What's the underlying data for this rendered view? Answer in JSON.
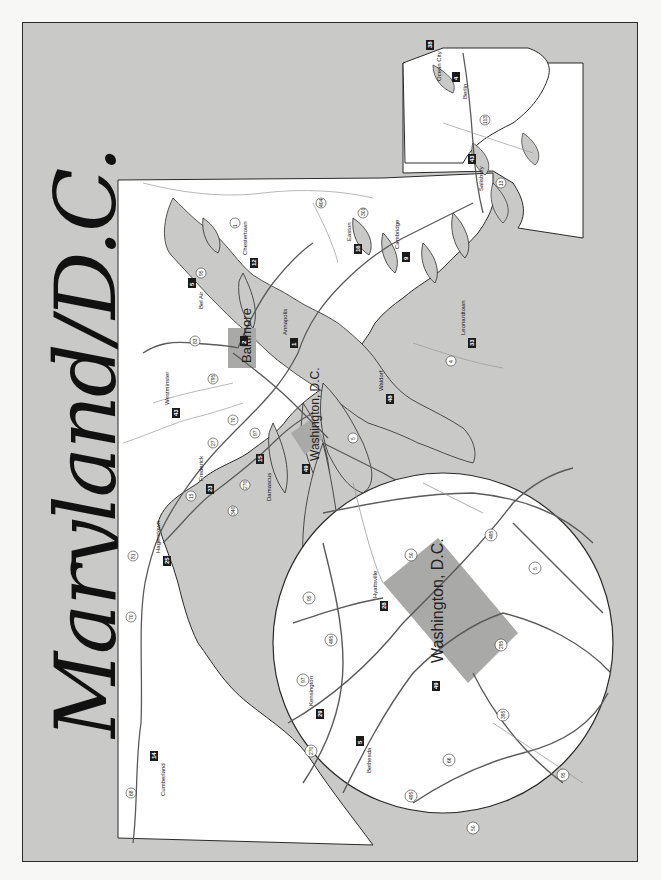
{
  "title": "Maryland/D.C.",
  "colors": {
    "background": "#f7f7f5",
    "water": "#c9c9c7",
    "land": "#ffffff",
    "metro_area": "#a9a9a7",
    "border": "#2a2a2a",
    "roads": "#5a5a5a",
    "label_box": "#1a1a1a"
  },
  "cities": [
    {
      "name": "Cumberland",
      "num": "14"
    },
    {
      "name": "Hagerstown",
      "num": "25"
    },
    {
      "name": "Boonsboro",
      "num": "3"
    },
    {
      "name": "Frederick",
      "num": "23"
    },
    {
      "name": "Knoxville",
      "num": "30"
    },
    {
      "name": "Brunswick",
      "num": "8"
    },
    {
      "name": "Emmitsburg",
      "num": "17"
    },
    {
      "name": "Westminster",
      "num": "43"
    },
    {
      "name": "Reisterstown",
      "num": "41"
    },
    {
      "name": "New Market",
      "num": "36"
    },
    {
      "name": "Mount Airy",
      "num": "33"
    },
    {
      "name": "Sykesville",
      "num": "45"
    },
    {
      "name": "Damascus",
      "num": "15"
    },
    {
      "name": "Laytonsville",
      "num": "31"
    },
    {
      "name": "Gaithersburg",
      "num": "24"
    },
    {
      "name": "Olney",
      "num": "38"
    },
    {
      "name": "Ellicott City",
      "num": "18"
    },
    {
      "name": "Laurel",
      "num": "32"
    },
    {
      "name": "Hyattsville",
      "num": "28"
    },
    {
      "name": "Bowie",
      "num": "6"
    },
    {
      "name": "Annapolis",
      "num": "1"
    },
    {
      "name": "Edgewater",
      "num": "16"
    },
    {
      "name": "Crofton",
      "num": "13"
    },
    {
      "name": "Millersville",
      "num": "34"
    },
    {
      "name": "Glen Burnie",
      "num": "22"
    },
    {
      "name": "Hanover",
      "num": "26"
    },
    {
      "name": "Baltimore",
      "num": "2"
    },
    {
      "name": "Cockeysville",
      "num": "10"
    },
    {
      "name": "Bel Air",
      "num": "5"
    },
    {
      "name": "Havre de Grace",
      "num": "29"
    },
    {
      "name": "North East",
      "num": "37"
    },
    {
      "name": "Elkton",
      "num": "19"
    },
    {
      "name": "Chestertown",
      "num": "12"
    },
    {
      "name": "Denton",
      "num": "15"
    },
    {
      "name": "Centreville",
      "num": "11"
    },
    {
      "name": "St. Michaels",
      "num": "42"
    },
    {
      "name": "Easton",
      "num": "16"
    },
    {
      "name": "Tilghman",
      "num": "47"
    },
    {
      "name": "Royal Oak",
      "num": "40"
    },
    {
      "name": "Oxford",
      "num": "39"
    },
    {
      "name": "Cambridge",
      "num": "9"
    },
    {
      "name": "Waldorf",
      "num": "48"
    },
    {
      "name": "Bryantown",
      "num": "7"
    },
    {
      "name": "Leonardtown",
      "num": "33"
    },
    {
      "name": "Salisbury",
      "num": "43"
    },
    {
      "name": "Berlin",
      "num": "4"
    },
    {
      "name": "Ocean City",
      "num": "38"
    },
    {
      "name": "Washington, D.C.",
      "num": "49"
    }
  ],
  "main_map": {
    "big_labels": [
      "Baltimore",
      "Washington, D.C."
    ],
    "route_shields": [
      "68",
      "70",
      "81",
      "15",
      "340",
      "270",
      "27",
      "97",
      "70",
      "795",
      "83",
      "95",
      "695",
      "1",
      "50",
      "301",
      "404",
      "13",
      "113",
      "50",
      "5",
      "4"
    ]
  },
  "inset": {
    "label": "Washington, D.C.",
    "cities": [
      {
        "name": "Hyattsville",
        "num": "28"
      },
      {
        "name": "Kensington",
        "num": "29"
      },
      {
        "name": "Bethesda",
        "num": "5"
      },
      {
        "name": "Washington, D.C.",
        "num": "49"
      }
    ],
    "route_shields": [
      "95",
      "495",
      "97",
      "270",
      "495",
      "66",
      "50",
      "395",
      "95",
      "295",
      "5",
      "495",
      "50"
    ]
  }
}
